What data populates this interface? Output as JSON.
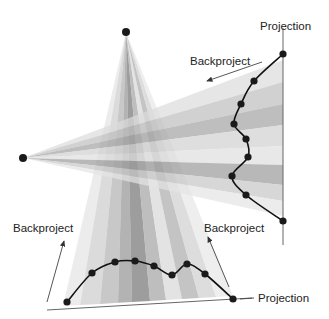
{
  "diagram": {
    "type": "backprojection-illustration",
    "labels": {
      "projection_right": "Projection",
      "backproject_right": "Backproject",
      "backproject_left": "Backproject",
      "backproject_bottom_right": "Backproject",
      "projection_bottom": "Projection"
    },
    "sources": [
      {
        "name": "top-source",
        "x": 126,
        "y": 32
      },
      {
        "name": "left-source",
        "x": 23,
        "y": 158
      }
    ],
    "vertical_fan": {
      "apex": [
        126,
        32
      ],
      "bands_at_bottom": [
        {
          "x0": 63,
          "x1": 80,
          "shade": "#e6e6e6"
        },
        {
          "x0": 80,
          "x1": 100,
          "shade": "#cfcfcf"
        },
        {
          "x0": 100,
          "x1": 118,
          "shade": "#b5b5b5"
        },
        {
          "x0": 118,
          "x1": 132,
          "shade": "#9a9a9a"
        },
        {
          "x0": 132,
          "x1": 150,
          "shade": "#7c7c7c"
        },
        {
          "x0": 150,
          "x1": 166,
          "shade": "#a8a8a8"
        },
        {
          "x0": 166,
          "x1": 182,
          "shade": "#dadada"
        },
        {
          "x0": 182,
          "x1": 199,
          "shade": "#b0b0b0"
        },
        {
          "x0": 199,
          "x1": 216,
          "shade": "#d2d2d2"
        },
        {
          "x0": 216,
          "x1": 233,
          "shade": "#e8e8e8"
        }
      ]
    },
    "horizontal_fan": {
      "apex": [
        23,
        158
      ],
      "bands_at_right": [
        {
          "y0": 60,
          "y1": 82,
          "shade": "#dcdcdc"
        },
        {
          "y0": 82,
          "y1": 104,
          "shade": "#bdbdbd"
        },
        {
          "y0": 104,
          "y1": 125,
          "shade": "#a2a2a2"
        },
        {
          "y0": 125,
          "y1": 146,
          "shade": "#d0d0d0"
        },
        {
          "y0": 146,
          "y1": 165,
          "shade": "#dedede"
        },
        {
          "y0": 165,
          "y1": 185,
          "shade": "#9a9a9a"
        },
        {
          "y0": 185,
          "y1": 201,
          "shade": "#c6c6c6"
        },
        {
          "y0": 201,
          "y1": 216,
          "shade": "#e4e4e4"
        }
      ]
    },
    "right_projection": {
      "axis": {
        "x": 283,
        "y0": 28,
        "y1": 245
      },
      "points": [
        [
          283,
          54
        ],
        [
          254,
          81
        ],
        [
          241,
          104
        ],
        [
          234,
          124
        ],
        [
          246,
          139
        ],
        [
          248,
          157
        ],
        [
          232,
          176
        ],
        [
          246,
          195
        ],
        [
          283,
          221
        ]
      ]
    },
    "bottom_projection": {
      "axis": {
        "x0": 47,
        "y0": 310,
        "x1": 252,
        "y1": 298
      },
      "points": [
        [
          67,
          302
        ],
        [
          92,
          273
        ],
        [
          115,
          262
        ],
        [
          135,
          261
        ],
        [
          154,
          266
        ],
        [
          172,
          275
        ],
        [
          187,
          264
        ],
        [
          205,
          274
        ],
        [
          233,
          299
        ]
      ]
    }
  }
}
